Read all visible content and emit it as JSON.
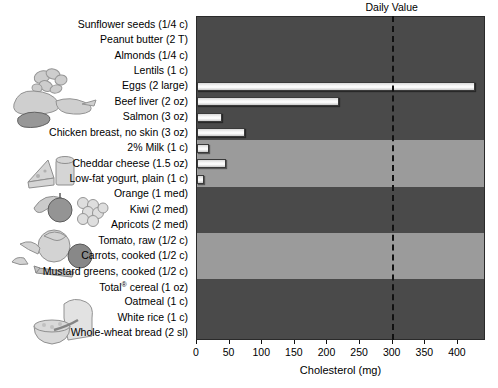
{
  "chart_data": {
    "type": "bar",
    "title": "",
    "xlabel": "Cholesterol (mg)",
    "ylabel": "",
    "orientation": "horizontal",
    "xlim": [
      0,
      443
    ],
    "xticks": [
      0,
      50,
      100,
      150,
      200,
      250,
      300,
      350,
      400
    ],
    "grid": false,
    "legend": "none",
    "categories": [
      "Sunflower seeds (1/4 c)",
      "Peanut butter (2 T)",
      "Almonds (1/4 c)",
      "Lentils (1 c)",
      "Eggs (2 large)",
      "Beef liver (2 oz)",
      "Salmon (3 oz)",
      "Chicken breast, no skin (3 oz)",
      "2% Milk (1 c)",
      "Cheddar cheese (1.5 oz)",
      "Low-fat yogurt, plain (1 c)",
      "Orange (1 med)",
      "Kiwi (2 med)",
      "Apricots (2 med)",
      "Tomato, raw (1/2 c)",
      "Carrots, cooked (1/2 c)",
      "Mustard greens, cooked (1/2 c)",
      "Total® cereal (1 oz)",
      "Oatmeal (1 c)",
      "White rice (1 c)",
      "Whole-wheat bread (2 sl)"
    ],
    "values": [
      0,
      0,
      0,
      0,
      426,
      217,
      38,
      74,
      18,
      45,
      11,
      0,
      0,
      0,
      0,
      0,
      0,
      0,
      0,
      0,
      0
    ],
    "annotations": [
      {
        "name": "daily-value",
        "label": "Daily Value",
        "x": 300,
        "style": "dashed-vertical-line"
      }
    ],
    "group_bands": [
      {
        "group": "nuts-seeds-legumes",
        "rows": [
          0,
          3
        ],
        "shade": "dark"
      },
      {
        "group": "animal-protein",
        "rows": [
          4,
          7
        ],
        "shade": "dark"
      },
      {
        "group": "dairy",
        "rows": [
          8,
          10
        ],
        "shade": "light"
      },
      {
        "group": "fruits",
        "rows": [
          11,
          13
        ],
        "shade": "dark"
      },
      {
        "group": "vegetables",
        "rows": [
          14,
          16
        ],
        "shade": "light"
      },
      {
        "group": "grains",
        "rows": [
          17,
          20
        ],
        "shade": "dark"
      }
    ]
  },
  "colors": {
    "band_dark": "#4a4a4a",
    "band_light": "#9b9b9b",
    "bar_fill": "#f2f2f2",
    "bar_edge": "#3a3a3a",
    "axis": "#111111",
    "background": "#ffffff"
  },
  "illustrations": [
    {
      "name": "nuts-illustration",
      "alt": "almonds and nuts"
    },
    {
      "name": "meat-poultry-illustration",
      "alt": "chicken, fish and liver"
    },
    {
      "name": "dairy-illustration",
      "alt": "cheese wedge and milk glass"
    },
    {
      "name": "fruit-illustration",
      "alt": "apple, banana and grapes"
    },
    {
      "name": "vegetable-illustration",
      "alt": "lettuce, tomato and carrot"
    },
    {
      "name": "grain-illustration",
      "alt": "bread slice and bowl of cereal"
    }
  ]
}
